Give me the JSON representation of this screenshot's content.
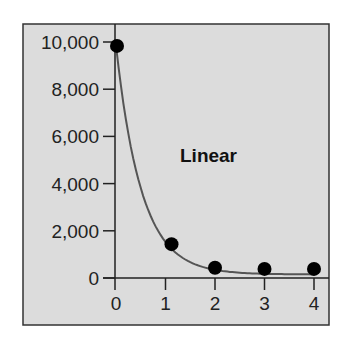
{
  "chart_data": {
    "type": "line",
    "title": "",
    "annotation": "Linear",
    "xlabel": "",
    "ylabel": "",
    "x": [
      0,
      1,
      2,
      3,
      4
    ],
    "series": [
      {
        "name": "data",
        "values": [
          9750,
          1350,
          350,
          300,
          300
        ],
        "marker": "circle",
        "line": "smooth"
      }
    ],
    "x_ticks": [
      "0",
      "1",
      "2",
      "3",
      "4"
    ],
    "y_ticks": [
      "0",
      "2,000",
      "4,000",
      "6,000",
      "8,000",
      "10,000"
    ],
    "xlim": [
      0,
      4
    ],
    "ylim": [
      0,
      10000
    ],
    "grid": false,
    "legend": "none"
  },
  "colors": {
    "panel_bg": "#dcdcdc",
    "frame": "#333333",
    "curve": "#555555",
    "marker": "#000000"
  }
}
